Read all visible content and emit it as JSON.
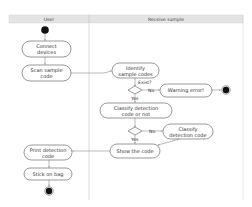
{
  "diagram": {
    "type": "UML activity diagram (swimlanes)",
    "lanes": [
      {
        "id": "user",
        "label": "User"
      },
      {
        "id": "receive",
        "label": "Receive sample"
      }
    ],
    "nodes": {
      "start": {
        "kind": "initial",
        "lane": "user"
      },
      "connect": {
        "kind": "action",
        "lane": "user",
        "line1": "Connect",
        "line2": "devices"
      },
      "scan": {
        "kind": "action",
        "lane": "user",
        "line1": "Scan sample",
        "line2": "code"
      },
      "identify": {
        "kind": "action",
        "lane": "receive",
        "line1": "Identify",
        "line2": "sample codes"
      },
      "decision1": {
        "kind": "decision",
        "lane": "receive",
        "label": "Exist?"
      },
      "warning": {
        "kind": "action",
        "lane": "receive",
        "line1": "Warning error!"
      },
      "end_error": {
        "kind": "final",
        "lane": "receive"
      },
      "classify_or_not": {
        "kind": "action",
        "lane": "receive",
        "line1": "Classify detection",
        "line2": "code or not"
      },
      "decision2": {
        "kind": "decision",
        "lane": "receive"
      },
      "classify": {
        "kind": "action",
        "lane": "receive",
        "line1": "Classify",
        "line2": "detection code"
      },
      "show": {
        "kind": "action",
        "lane": "receive",
        "line1": "Show the code"
      },
      "print": {
        "kind": "action",
        "lane": "user",
        "line1": "Print detection",
        "line2": "code"
      },
      "stick": {
        "kind": "action",
        "lane": "user",
        "line1": "Stick on bag"
      },
      "end": {
        "kind": "final",
        "lane": "user"
      }
    },
    "guards": {
      "d1_no": "No",
      "d1_yes": "Yes",
      "d2_no": "No",
      "d2_yes": "Yes"
    },
    "edges": [
      [
        "start",
        "connect"
      ],
      [
        "connect",
        "scan"
      ],
      [
        "scan",
        "identify"
      ],
      [
        "identify",
        "decision1"
      ],
      [
        "decision1",
        "warning",
        "No"
      ],
      [
        "warning",
        "end_error"
      ],
      [
        "decision1",
        "classify_or_not",
        "Yes"
      ],
      [
        "classify_or_not",
        "decision2"
      ],
      [
        "decision2",
        "classify",
        "No"
      ],
      [
        "decision2",
        "show",
        "Yes"
      ],
      [
        "classify",
        "show"
      ],
      [
        "show",
        "print"
      ],
      [
        "print",
        "stick"
      ],
      [
        "stick",
        "end"
      ]
    ]
  }
}
